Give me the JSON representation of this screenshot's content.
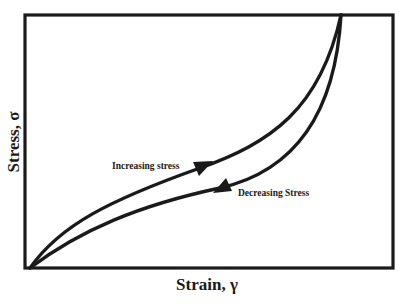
{
  "diagram": {
    "type": "stress-strain hysteresis loop",
    "x_axis": {
      "label": "Strain, γ"
    },
    "y_axis": {
      "label": "Stress, σ"
    },
    "curves": [
      {
        "name": "loading",
        "label": "Increasing stress",
        "direction": "up-right"
      },
      {
        "name": "unloading",
        "label": "Decreasing Stress",
        "direction": "down-left"
      }
    ],
    "colors": {
      "line": "#1a1a1a",
      "background": "#ffffff"
    }
  }
}
